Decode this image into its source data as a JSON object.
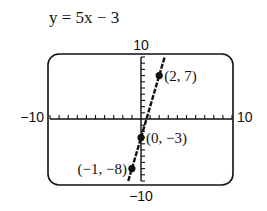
{
  "chart_data": {
    "type": "line",
    "title": "y = 5x − 3",
    "equation": {
      "slope": 5,
      "intercept": -3
    },
    "xlim": [
      -10,
      10
    ],
    "ylim": [
      -10,
      10
    ],
    "xscale": 1,
    "yscale": 1,
    "tick_labels": {
      "xmin": "−10",
      "xmax": "10",
      "ymin": "−10",
      "ymax": "10"
    },
    "points": [
      {
        "x": 2,
        "y": 7,
        "label": "(2, 7)",
        "label_side": "right"
      },
      {
        "x": 0,
        "y": -3,
        "label": "(0, −3)",
        "label_side": "right"
      },
      {
        "x": -1,
        "y": -8,
        "label": "(−1, −8)",
        "label_side": "left"
      }
    ],
    "grid": false,
    "legend": "none",
    "colors": {
      "ink": "#111111",
      "background": "#ffffff"
    }
  }
}
